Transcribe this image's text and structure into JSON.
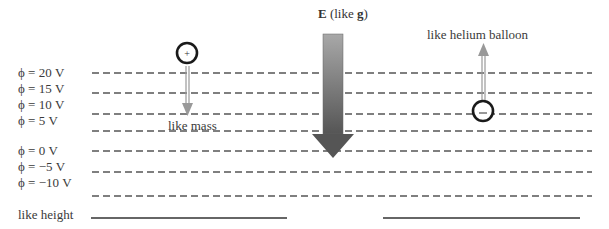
{
  "title": {
    "field_symbol": "E",
    "field_suffix_open": " (like ",
    "analogy_symbol": "g",
    "field_suffix_close": ")"
  },
  "equipotentials": [
    {
      "label": "ϕ = 20 V",
      "y": 73
    },
    {
      "label": "ϕ = 15 V",
      "y": 93
    },
    {
      "label": "ϕ = 10 V",
      "y": 114
    },
    {
      "label": "ϕ = 5 V",
      "y": 131
    },
    {
      "label": "ϕ = 0 V",
      "y": 151
    },
    {
      "label": "ϕ = −5 V",
      "y": 172
    },
    {
      "label": "ϕ = −10 V",
      "y": 196
    }
  ],
  "positive_charge": {
    "symbol": "+",
    "caption": "like mass"
  },
  "negative_charge": {
    "symbol": "−",
    "caption": "like helium balloon"
  },
  "height_label": "like height",
  "colors": {
    "dash": "#555555",
    "arrow_dark": "#555555",
    "arrow_light": "#9a9a9a",
    "charge_ring": "#1a1a1a",
    "force_arrow": "#999999"
  }
}
